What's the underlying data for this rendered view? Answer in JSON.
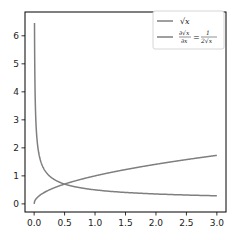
{
  "chart_data": {
    "type": "line",
    "title": "",
    "xlabel": "",
    "ylabel": "",
    "xlim": [
      -0.15,
      3.15
    ],
    "ylim": [
      -0.29,
      6.85
    ],
    "grid": false,
    "legend_position": "upper right",
    "x_ticks": [
      "0.0",
      "0.5",
      "1.0",
      "1.5",
      "2.0",
      "2.5",
      "3.0"
    ],
    "y_ticks": [
      "0",
      "1",
      "2",
      "3",
      "4",
      "5",
      "6"
    ],
    "series": [
      {
        "name": "√x",
        "color": "#7f7f7f",
        "function": "sqrt(x)",
        "x": [
          0.0,
          0.05,
          0.1,
          0.25,
          0.5,
          1.0,
          1.5,
          2.0,
          2.5,
          3.0
        ],
        "values": [
          0.0,
          0.22,
          0.32,
          0.5,
          0.71,
          1.0,
          1.22,
          1.41,
          1.58,
          1.73
        ]
      },
      {
        "name": "∂√x/∂x = 1/(2√x)",
        "color": "#7f7f7f",
        "function": "1/(2*sqrt(x))",
        "x": [
          0.006,
          0.01,
          0.05,
          0.1,
          0.25,
          0.5,
          1.0,
          1.5,
          2.0,
          2.5,
          3.0
        ],
        "values": [
          6.5,
          5.0,
          2.24,
          1.58,
          1.0,
          0.71,
          0.5,
          0.41,
          0.35,
          0.32,
          0.29
        ]
      }
    ]
  },
  "legend": {
    "entry1": "√x",
    "entry2_num": "∂√x",
    "entry2_den": "∂x",
    "entry2_eq": "=",
    "entry2_rhs_num": "1",
    "entry2_rhs_den": "2√x"
  },
  "ticks": {
    "x": [
      "0.0",
      "0.5",
      "1.0",
      "1.5",
      "2.0",
      "2.5",
      "3.0"
    ],
    "y": [
      "0",
      "1",
      "2",
      "3",
      "4",
      "5",
      "6"
    ]
  }
}
